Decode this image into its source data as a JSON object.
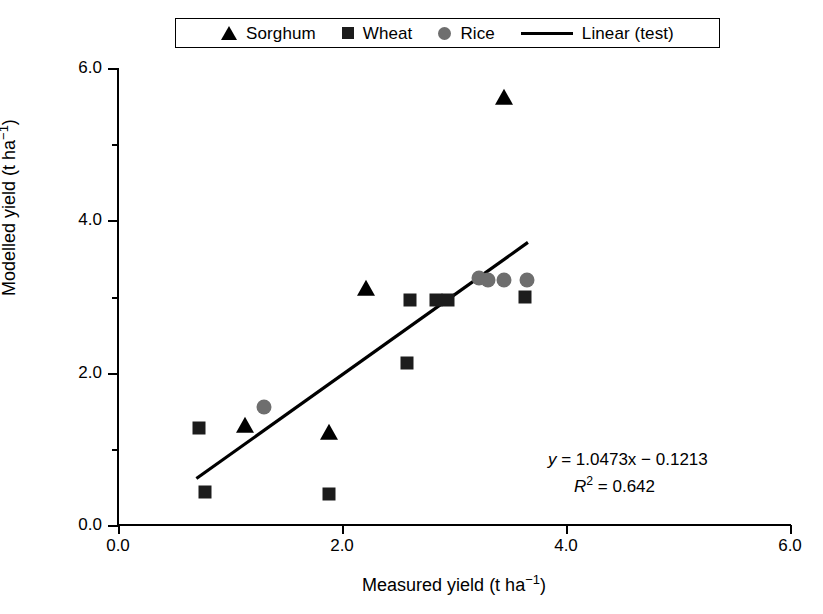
{
  "chart_data": {
    "type": "scatter",
    "title": "",
    "xlabel": "Measured yield (t ha-1)",
    "ylabel": "Modelled yield (t ha-1)",
    "xlabel_parts": {
      "text": "Measured yield (t ha",
      "sup": "−1",
      "tail": ")"
    },
    "ylabel_parts": {
      "text": "Modelled yield (t ha",
      "sup": "−1",
      "tail": ")"
    },
    "xlim": [
      0.0,
      6.0
    ],
    "ylim": [
      0.0,
      6.0
    ],
    "xticks": [
      0.0,
      2.0,
      4.0,
      6.0
    ],
    "xticklabels": [
      "0.0",
      "2.0",
      "4.0",
      "6.0"
    ],
    "yticks": [
      0.0,
      2.0,
      4.0,
      6.0
    ],
    "yticklabels": [
      "0.0",
      "2.0",
      "4.0",
      "6.0"
    ],
    "yminorticks": [
      1.0,
      3.0,
      5.0
    ],
    "grid": false,
    "legend_position": "top-center",
    "series": [
      {
        "name": "Sorghum",
        "marker": "triangle",
        "color": "#000000",
        "points": [
          {
            "x": 1.13,
            "y": 1.3
          },
          {
            "x": 1.88,
            "y": 1.21
          },
          {
            "x": 2.21,
            "y": 3.1
          },
          {
            "x": 3.45,
            "y": 5.6
          }
        ]
      },
      {
        "name": "Wheat",
        "marker": "square",
        "color": "#1c1c1c",
        "points": [
          {
            "x": 0.72,
            "y": 1.27
          },
          {
            "x": 0.78,
            "y": 0.43
          },
          {
            "x": 1.88,
            "y": 0.41
          },
          {
            "x": 2.58,
            "y": 2.13
          },
          {
            "x": 2.61,
            "y": 2.95
          },
          {
            "x": 2.84,
            "y": 2.95
          },
          {
            "x": 2.95,
            "y": 2.96
          },
          {
            "x": 3.63,
            "y": 2.99
          }
        ]
      },
      {
        "name": "Rice",
        "marker": "circle",
        "color": "#6e6e6e",
        "points": [
          {
            "x": 1.3,
            "y": 1.55
          },
          {
            "x": 3.22,
            "y": 3.24
          },
          {
            "x": 3.3,
            "y": 3.22
          },
          {
            "x": 3.45,
            "y": 3.22
          },
          {
            "x": 3.65,
            "y": 3.22
          }
        ]
      }
    ],
    "trendline": {
      "name": "Linear (test)",
      "color": "#000000",
      "slope": 1.0473,
      "intercept": -0.1213,
      "r_squared": 0.642,
      "x_start": 0.7,
      "x_end": 3.66,
      "y_start": 0.61,
      "y_end": 3.71
    },
    "annotations": {
      "equation_line1": {
        "lhs": "y",
        "body": " = 1.0473x − 0.1213"
      },
      "equation_line2": {
        "lhs": "R",
        "sup": "2",
        "body": " = 0.642"
      }
    }
  },
  "legend": {
    "entries": [
      {
        "label": "Sorghum",
        "marker": "triangle-icon"
      },
      {
        "label": "Wheat",
        "marker": "square-icon"
      },
      {
        "label": "Rice",
        "marker": "circle-icon"
      },
      {
        "label": "Linear (test)",
        "marker": "line-icon"
      }
    ]
  }
}
